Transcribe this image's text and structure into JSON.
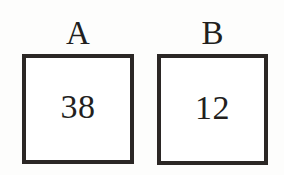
{
  "figure": {
    "background_color": "#fdfdfc",
    "border_color": "#2b2725",
    "text_color": "#231f1e",
    "groups": [
      {
        "label": "A",
        "value": "38"
      },
      {
        "label": "B",
        "value": "12"
      }
    ]
  }
}
